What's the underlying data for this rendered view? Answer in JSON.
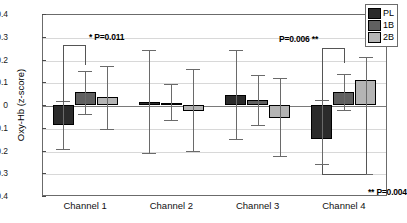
{
  "chart_data": {
    "type": "bar",
    "title": "",
    "xlabel": "",
    "ylabel": "Oxy-Hb (z-score)",
    "categories": [
      "Channel 1",
      "Channel 2",
      "Channel 3",
      "Channel 4"
    ],
    "ylim": [
      -0.4,
      0.4
    ],
    "ytick_labels": [
      "0.4",
      "0.3",
      "0.2",
      "0.1",
      "0",
      "-0.1",
      "-0.2",
      "-0.3",
      "-0.4"
    ],
    "ytick_values": [
      0.4,
      0.3,
      0.2,
      0.1,
      0,
      -0.1,
      -0.2,
      -0.3,
      -0.4
    ],
    "grid": true,
    "legend_position": "top-right",
    "series": [
      {
        "name": "PL",
        "color": "#2b2b2b",
        "values": [
          -0.09,
          0.012,
          0.045,
          -0.15
        ],
        "err_low": [
          -0.195,
          -0.21,
          -0.148,
          -0.258
        ],
        "err_high": [
          0.018,
          0.24,
          0.24,
          0.02
        ]
      },
      {
        "name": "1B",
        "color": "#606060",
        "values": [
          0.058,
          0.01,
          0.021,
          0.058
        ],
        "err_low": [
          -0.04,
          -0.066,
          -0.09,
          -0.02
        ],
        "err_high": [
          0.15,
          0.092,
          0.13,
          0.137
        ]
      },
      {
        "name": "2B",
        "color": "#b4b4b4",
        "values": [
          0.035,
          -0.025,
          -0.057,
          0.108
        ],
        "err_low": [
          -0.105,
          -0.202,
          -0.225,
          -0.305
        ],
        "err_high": [
          0.172,
          0.158,
          0.118,
          0.212
        ]
      }
    ],
    "annotations": [
      {
        "id": "sig-channel1",
        "text": "*  P=0.011",
        "p_value": "0.011",
        "stars": "*"
      },
      {
        "id": "sig-channel4-upper",
        "text": "P=0.006  **",
        "p_value": "0.006",
        "stars": "**"
      },
      {
        "id": "sig-channel4-lower",
        "text": "**  P=0.004",
        "p_value": "0.004",
        "stars": "**"
      }
    ]
  },
  "legend": {
    "items": [
      {
        "label": "PL",
        "color": "#2b2b2b"
      },
      {
        "label": "1B",
        "color": "#606060"
      },
      {
        "label": "2B",
        "color": "#b4b4b4"
      }
    ]
  }
}
